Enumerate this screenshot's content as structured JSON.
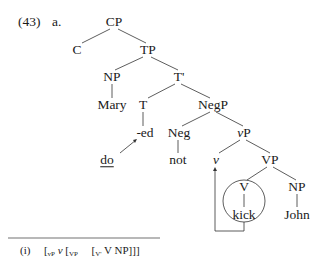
{
  "example": {
    "number": "(43)",
    "sub_label": "a."
  },
  "tree": {
    "nodes": {
      "CP": "CP",
      "C": "C",
      "TP": "TP",
      "NP_subj": "NP",
      "T_bar": "T'",
      "Mary": "Mary",
      "T": "T",
      "NegP": "NegP",
      "ed": "-ed",
      "Neg": "Neg",
      "vP": "vP",
      "do": "do",
      "not": "not",
      "v": "v",
      "VP": "VP",
      "V": "V",
      "NP_obj": "NP",
      "kick": "kick",
      "John": "John"
    },
    "movements": [
      {
        "from": "do",
        "to": "-ed",
        "type": "arrow"
      },
      {
        "from": "kick",
        "to": "v",
        "type": "bracket-arrow"
      }
    ],
    "circled": [
      "V",
      "kick"
    ]
  },
  "footnote": {
    "marker": "(i)",
    "b1": "[",
    "s1": "vP",
    "t1": "v",
    "b2": "[",
    "s2": "VP",
    "b3": "[",
    "s3": "V'",
    "t3": "V",
    "t4": "NP]]]"
  }
}
